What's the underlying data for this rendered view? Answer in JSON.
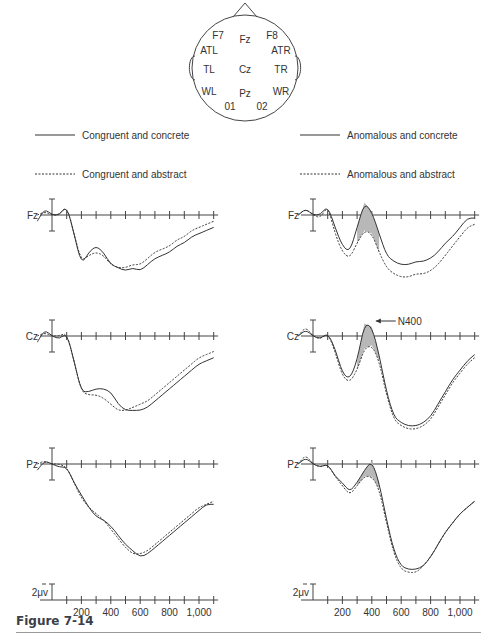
{
  "head_map": {
    "electrodes": [
      {
        "label": "F7",
        "x": 218,
        "y": 39
      },
      {
        "label": "Fz",
        "x": 245,
        "y": 43
      },
      {
        "label": "F8",
        "x": 272,
        "y": 39
      },
      {
        "label": "ATL",
        "x": 209,
        "y": 54
      },
      {
        "label": "ATR",
        "x": 281,
        "y": 54
      },
      {
        "label": "TL",
        "x": 209,
        "y": 73
      },
      {
        "label": "Cz",
        "x": 245,
        "y": 73
      },
      {
        "label": "TR",
        "x": 281,
        "y": 73
      },
      {
        "label": "WL",
        "x": 209,
        "y": 95
      },
      {
        "label": "Pz",
        "x": 245,
        "y": 97
      },
      {
        "label": "WR",
        "x": 281,
        "y": 95
      },
      {
        "label": "01",
        "x": 230,
        "y": 110
      },
      {
        "label": "02",
        "x": 262,
        "y": 110
      }
    ]
  },
  "legend": {
    "left": [
      {
        "label": "Congruent and concrete",
        "style": "solid"
      },
      {
        "label": "Congruent and abstract",
        "style": "dashed"
      }
    ],
    "right": [
      {
        "label": "Anomalous and concrete",
        "style": "solid"
      },
      {
        "label": "Anomalous and abstract",
        "style": "dashed"
      }
    ]
  },
  "scale": {
    "amplitude_label": "2μv",
    "x_tick_labels": [
      "200",
      "400",
      "600",
      "800",
      "1,000"
    ]
  },
  "annotation": {
    "label": "N400"
  },
  "caption": {
    "label": "Figure 7-14"
  },
  "colors": {
    "shade": "#b8b8b8",
    "line": "#333333",
    "axis": "#444444"
  },
  "chart_data": [
    {
      "type": "line",
      "title": "Congruent sentences",
      "xlabel": "Time (ms)",
      "ylabel": "Amplitude (μV, negative up)",
      "x_ticks": [
        0,
        100,
        200,
        300,
        400,
        500,
        600,
        700,
        800,
        900,
        1000,
        1100
      ],
      "x_tick_labels": [
        "200",
        "400",
        "600",
        "800",
        "1,000"
      ],
      "grid": false,
      "channels": [
        {
          "name": "Fz",
          "x": [
            -100,
            -50,
            0,
            50,
            100,
            150,
            200,
            250,
            300,
            350,
            400,
            450,
            500,
            550,
            600,
            650,
            700,
            750,
            800,
            850,
            900,
            950,
            1000,
            1050,
            1100
          ],
          "series": [
            {
              "name": "Congruent and concrete",
              "values": [
                -1,
                1,
                0,
                0,
                1.5,
                -3,
                -8,
                -6,
                -5,
                -6,
                -8,
                -8.5,
                -9,
                -8.5,
                -9,
                -8,
                -7,
                -6.5,
                -6,
                -5,
                -4.5,
                -3.5,
                -3,
                -2.5,
                -2
              ]
            },
            {
              "name": "Congruent and abstract",
              "values": [
                0,
                0.5,
                0,
                0,
                1.5,
                -3,
                -7.5,
                -6.5,
                -6,
                -6.5,
                -8,
                -8.5,
                -8.5,
                -8,
                -8,
                -7,
                -6,
                -5.5,
                -5,
                -4,
                -3.5,
                -2.5,
                -2,
                -1.5,
                -1
              ]
            }
          ]
        },
        {
          "name": "Cz",
          "x": [
            -100,
            -50,
            0,
            50,
            100,
            150,
            200,
            250,
            300,
            350,
            400,
            450,
            500,
            550,
            600,
            650,
            700,
            750,
            800,
            850,
            900,
            950,
            1000,
            1050,
            1100
          ],
          "series": [
            {
              "name": "Congruent and concrete",
              "values": [
                -1,
                1,
                0,
                -0.5,
                0.5,
                -4,
                -9,
                -9,
                -8.5,
                -8.5,
                -9,
                -11,
                -12,
                -12,
                -12,
                -11.5,
                -10.5,
                -9.5,
                -8.5,
                -7.5,
                -6.5,
                -5.5,
                -4.5,
                -4,
                -3.5
              ]
            },
            {
              "name": "Congruent and abstract",
              "values": [
                0,
                0.5,
                0,
                0,
                0.5,
                -4,
                -9,
                -9.5,
                -9.5,
                -10,
                -11,
                -12,
                -12,
                -11.5,
                -11,
                -10.5,
                -9.5,
                -8.5,
                -7.5,
                -6.5,
                -5.5,
                -4.5,
                -3.5,
                -3,
                -2.5
              ]
            }
          ]
        },
        {
          "name": "Pz",
          "x": [
            -100,
            -50,
            0,
            50,
            100,
            150,
            200,
            250,
            300,
            350,
            400,
            450,
            500,
            550,
            600,
            650,
            700,
            750,
            800,
            850,
            900,
            950,
            1000,
            1050,
            1100
          ],
          "series": [
            {
              "name": "Congruent and concrete",
              "values": [
                -1,
                0.5,
                0,
                -0.5,
                -0.5,
                -3,
                -5,
                -7,
                -8.5,
                -9,
                -10,
                -11.5,
                -13,
                -14,
                -15,
                -14.5,
                -13.5,
                -12.5,
                -11.5,
                -10.5,
                -9.5,
                -8.5,
                -7.5,
                -6.5,
                -6.5
              ]
            },
            {
              "name": "Congruent and abstract",
              "values": [
                0,
                0.5,
                0,
                0,
                -0.5,
                -3,
                -5.5,
                -7,
                -8,
                -9,
                -10.5,
                -12,
                -13.5,
                -14.5,
                -14.5,
                -14,
                -13,
                -12,
                -11,
                -10,
                -9,
                -8,
                -7,
                -6.5,
                -6
              ]
            }
          ]
        }
      ]
    },
    {
      "type": "line",
      "title": "Anomalous sentences",
      "xlabel": "Time (ms)",
      "ylabel": "Amplitude (μV, negative up)",
      "x_ticks": [
        0,
        100,
        200,
        300,
        400,
        500,
        600,
        700,
        800,
        900,
        1000,
        1100
      ],
      "x_tick_labels": [
        "200",
        "400",
        "600",
        "800",
        "1,000"
      ],
      "grid": false,
      "annotations": [
        {
          "text": "N400",
          "channel": "Cz",
          "x": 400
        }
      ],
      "shaded_region": {
        "between": [
          "Anomalous and concrete",
          "Anomalous and abstract"
        ],
        "x_range": [
          300,
          450
        ]
      },
      "channels": [
        {
          "name": "Fz",
          "x": [
            -100,
            -50,
            0,
            50,
            100,
            150,
            200,
            250,
            300,
            350,
            400,
            450,
            500,
            550,
            600,
            650,
            700,
            750,
            800,
            850,
            900,
            950,
            1000,
            1050,
            1100
          ],
          "series": [
            {
              "name": "Anomalous and concrete",
              "values": [
                0,
                1,
                0,
                0,
                1.5,
                -2,
                -5,
                -6,
                -2,
                2,
                0.5,
                -3,
                -6.5,
                -7.5,
                -8,
                -8,
                -7.5,
                -7.5,
                -7,
                -6,
                -4.5,
                -3.5,
                -2,
                -0.5,
                -0.5
              ]
            },
            {
              "name": "Anomalous and abstract",
              "values": [
                0,
                1,
                0,
                -0.5,
                1.5,
                -3,
                -6,
                -7,
                -4.5,
                -2.5,
                -3,
                -6,
                -8.5,
                -9.5,
                -10,
                -10,
                -9.5,
                -9.5,
                -9,
                -8,
                -6.5,
                -5,
                -3.5,
                -2,
                -1.5
              ]
            }
          ]
        },
        {
          "name": "Cz",
          "x": [
            -100,
            -50,
            0,
            50,
            100,
            150,
            200,
            250,
            300,
            350,
            400,
            450,
            500,
            550,
            600,
            650,
            700,
            750,
            800,
            850,
            900,
            950,
            1000,
            1050,
            1100
          ],
          "series": [
            {
              "name": "Anomalous and concrete",
              "values": [
                0,
                1,
                0,
                -0.5,
                0.5,
                -2,
                -6,
                -7,
                -4,
                2,
                1.5,
                -3,
                -9,
                -13,
                -14,
                -14.5,
                -14.5,
                -14,
                -13,
                -11,
                -9,
                -7,
                -5.5,
                -4,
                -3
              ]
            },
            {
              "name": "Anomalous and abstract",
              "values": [
                0,
                1.5,
                0,
                -0.5,
                0.5,
                -2.5,
                -6.5,
                -7.5,
                -5.5,
                -2,
                -1.5,
                -4,
                -9.5,
                -13.5,
                -14.5,
                -15,
                -15,
                -14.5,
                -13.5,
                -11.5,
                -9.5,
                -7.5,
                -6,
                -4.5,
                -3.5
              ]
            }
          ]
        },
        {
          "name": "Pz",
          "x": [
            -100,
            -50,
            0,
            50,
            100,
            150,
            200,
            250,
            300,
            350,
            400,
            450,
            500,
            550,
            600,
            650,
            700,
            750,
            800,
            850,
            900,
            950,
            1000,
            1050,
            1100
          ],
          "series": [
            {
              "name": "Anomalous and concrete",
              "values": [
                0,
                1,
                0,
                -0.5,
                0,
                -2,
                -3,
                -4.5,
                -3,
                -1,
                0.5,
                -3,
                -9,
                -14,
                -16.5,
                -17,
                -17,
                -16.5,
                -15,
                -13,
                -11,
                -9.5,
                -8,
                -7,
                -6
              ]
            },
            {
              "name": "Anomalous and abstract",
              "values": [
                0,
                1.5,
                0,
                -0.5,
                0,
                -2,
                -3.5,
                -5,
                -3.5,
                -2,
                -2,
                -4,
                -9.5,
                -14.5,
                -17,
                -17.5,
                -17.5,
                -16.5,
                -15,
                -13,
                -11,
                -9.5,
                -8,
                -7,
                -6
              ]
            }
          ]
        }
      ]
    }
  ]
}
